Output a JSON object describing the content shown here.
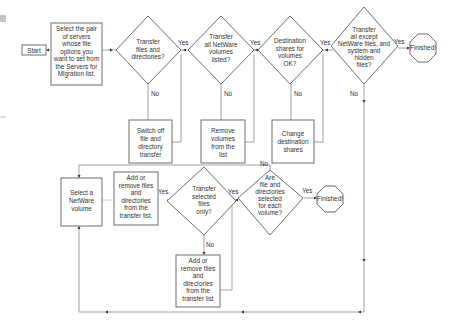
{
  "diagram": {
    "nodes": {
      "start": {
        "lines": [
          "Start"
        ]
      },
      "select_pair": {
        "lines": [
          "Select the pair",
          "of servers",
          "whose file",
          "options you",
          "want to set  from",
          "the Servers for",
          "Migration list."
        ]
      },
      "q_transfer_files": {
        "lines": [
          "Transfer",
          "files and",
          "directories?"
        ]
      },
      "q_transfer_volumes": {
        "lines": [
          "Transfer",
          "all NetWare",
          "volumes",
          "listed?"
        ]
      },
      "q_destination": {
        "lines": [
          "Destination",
          "shares for",
          "volumes",
          "OK?"
        ]
      },
      "q_except_system": {
        "lines": [
          "Transfer",
          "all except",
          "NetWare files, and",
          "system and",
          "hidden",
          "files?"
        ]
      },
      "finished_1": {
        "lines": [
          "Finished!"
        ]
      },
      "switch_off": {
        "lines": [
          "Switch off",
          "file and",
          "directory",
          "transfer"
        ]
      },
      "remove_volumes": {
        "lines": [
          "Remove",
          "volumes",
          "from the",
          "list"
        ]
      },
      "change_shares": {
        "lines": [
          "Change",
          "destination",
          "shares"
        ]
      },
      "select_volume": {
        "lines": [
          "Select a",
          "NetWare",
          "volume"
        ]
      },
      "add_remove_1": {
        "lines": [
          "Add or",
          "remove files",
          "and",
          "directories",
          "from the",
          "transfer list."
        ]
      },
      "q_selected_only": {
        "lines": [
          "Transfer",
          "selected",
          "files",
          "only?"
        ]
      },
      "q_each_volume": {
        "lines": [
          "Are",
          "file and",
          "directories",
          "selected",
          "for each",
          "volume?"
        ]
      },
      "finished_2": {
        "lines": [
          "Finished!"
        ]
      },
      "add_remove_2": {
        "lines": [
          "Add or",
          "remove files",
          "and",
          "directories",
          "from the",
          "transfer list"
        ]
      }
    },
    "edge_labels": {
      "yes": "Yes",
      "no": "No"
    },
    "colors": {
      "stroke": "#6e6e6e",
      "line": "#8a8a8a",
      "text": "#333333",
      "background": "#ffffff"
    }
  }
}
